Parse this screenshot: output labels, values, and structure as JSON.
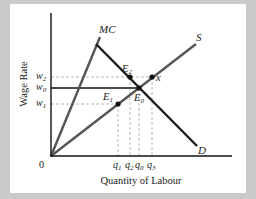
{
  "diagram": {
    "title": "",
    "axes": {
      "x_label": "Quantity of Labour",
      "y_label": "Wage Rate",
      "origin_label": "0"
    },
    "curves": [
      {
        "id": "MC",
        "label": "MC",
        "type": "upward line from origin"
      },
      {
        "id": "S",
        "label": "S",
        "type": "upward line from origin"
      },
      {
        "id": "D",
        "label": "D",
        "type": "downward sloping line"
      }
    ],
    "wage_levels": [
      {
        "label": "w",
        "sub": "2",
        "style": "dashed"
      },
      {
        "label": "w",
        "sub": "0",
        "style": "solid"
      },
      {
        "label": "w",
        "sub": "1",
        "style": "dashed"
      }
    ],
    "quantity_levels": [
      {
        "label": "q",
        "sub": "1"
      },
      {
        "label": "q",
        "sub": "2"
      },
      {
        "label": "q",
        "sub": "0"
      },
      {
        "label": "q",
        "sub": "3"
      }
    ],
    "points": [
      {
        "label": "E",
        "sub": "2"
      },
      {
        "label": "E",
        "sub": "0"
      },
      {
        "label": "E",
        "sub": "1"
      },
      {
        "label": "x",
        "sub": ""
      }
    ],
    "colors": {
      "background": "#c9c9c9",
      "panel": "#ffffff",
      "axis": "#111111",
      "demand": "#1a1a1a",
      "supply": "#555555",
      "mc": "#555555",
      "dashed": "#aaaaaa"
    }
  }
}
